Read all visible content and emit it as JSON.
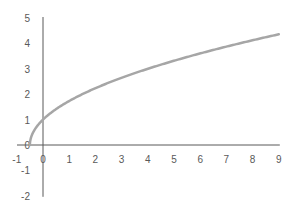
{
  "chart_data": {
    "type": "line",
    "title": "",
    "xlabel": "",
    "ylabel": "",
    "function": "y = sqrt(2x + 1)",
    "xlim": [
      -1,
      9
    ],
    "ylim": [
      -2,
      5
    ],
    "grid": false,
    "legend": null,
    "x_ticks": [
      "-1",
      "0",
      "1",
      "2",
      "3",
      "4",
      "5",
      "6",
      "7",
      "8",
      "9"
    ],
    "y_ticks": [
      "5",
      "4",
      "3",
      "2",
      "1",
      "0",
      "-1",
      "-2"
    ],
    "series": [
      {
        "name": "curve",
        "color": "#a6a6a6",
        "x": [
          -0.5,
          -0.45,
          -0.4,
          -0.3,
          -0.2,
          0,
          0.5,
          1,
          2,
          3,
          4,
          5,
          6,
          7,
          8,
          9
        ],
        "y": [
          0,
          0.32,
          0.45,
          0.63,
          0.77,
          1,
          1.41,
          1.73,
          2.24,
          2.65,
          3,
          3.32,
          3.61,
          3.87,
          4.12,
          4.36
        ]
      }
    ],
    "axis_color": "#595959"
  }
}
